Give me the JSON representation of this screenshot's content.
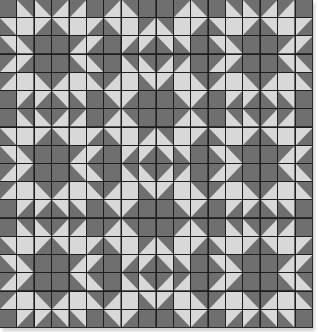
{
  "quilt": {
    "grid_cells": 18,
    "block_size": 6,
    "colors": {
      "dark": "#6f6f6f",
      "light": "#d8d8d8",
      "seam": "#1e1e1e"
    },
    "block_layout": [
      [
        "star",
        "diamond",
        "star"
      ],
      [
        "star",
        "diamond",
        "star"
      ],
      [
        "star",
        "diamond",
        "star"
      ]
    ],
    "blocks": {
      "star": [
        [
          "D",
          "BL",
          "BL",
          "BR",
          "BR",
          "D"
        ],
        [
          "TR",
          "L",
          "TL",
          "TR",
          "L",
          "TL"
        ],
        [
          "TR",
          "BL",
          "D",
          "D",
          "BR",
          "TL"
        ],
        [
          "BR",
          "TL",
          "D",
          "D",
          "TR",
          "BL"
        ],
        [
          "BR",
          "L",
          "BL",
          "BR",
          "L",
          "BL"
        ],
        [
          "D",
          "TL",
          "TL",
          "TR",
          "TR",
          "D"
        ]
      ],
      "diamond": [
        [
          "BR",
          "BL",
          "D",
          "D",
          "BR",
          "BL"
        ],
        [
          "TR",
          "L",
          "BR",
          "BL",
          "L",
          "TL"
        ],
        [
          "D",
          "TL",
          "TL",
          "TR",
          "TR",
          "D"
        ],
        [
          "D",
          "BL",
          "BL",
          "BR",
          "BR",
          "D"
        ],
        [
          "BR",
          "L",
          "TR",
          "TL",
          "L",
          "BL"
        ],
        [
          "TR",
          "TL",
          "D",
          "D",
          "TR",
          "TL"
        ]
      ]
    }
  }
}
